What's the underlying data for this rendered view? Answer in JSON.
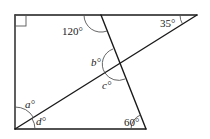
{
  "diagram": {
    "type": "geometry-figure",
    "colors": {
      "line": "#1a1a1a",
      "arc": "#555555",
      "background": "#ffffff"
    },
    "labels": {
      "angle_120": "120°",
      "angle_35": "35°",
      "angle_60": "60°",
      "angle_a": "a°",
      "angle_b": "b°",
      "angle_c": "c°",
      "angle_d": "d°"
    },
    "right_angle_marker": true
  }
}
